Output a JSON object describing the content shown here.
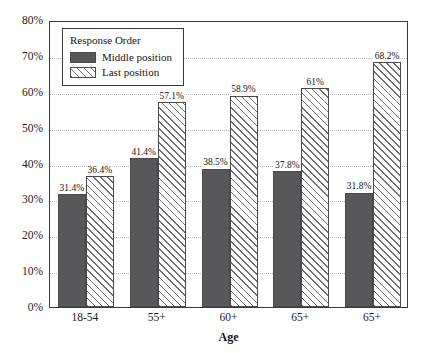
{
  "chart_data": {
    "type": "bar",
    "title": "",
    "xlabel": "Age",
    "ylabel": "",
    "ylim": [
      0,
      80
    ],
    "y_unit": "%",
    "grid": true,
    "legend_position": "upper-left-inside",
    "legend_title": "Response Order",
    "categories": [
      "18-54",
      "55+",
      "60+",
      "65+",
      "65+"
    ],
    "yticks": [
      "0%",
      "10%",
      "20%",
      "30%",
      "40%",
      "50%",
      "60%",
      "70%",
      "80%"
    ],
    "ytick_values": [
      0,
      10,
      20,
      30,
      40,
      50,
      60,
      70,
      80
    ],
    "series": [
      {
        "name": "Middle position",
        "values": [
          31.4,
          41.4,
          38.5,
          37.8,
          31.8
        ],
        "labels": [
          "31.4%",
          "41.4%",
          "38.5%",
          "37.8%",
          "31.8%"
        ],
        "color": "#58585a",
        "pattern": "solid"
      },
      {
        "name": "Last position",
        "values": [
          36.4,
          57.1,
          58.9,
          61.0,
          68.2
        ],
        "labels": [
          "36.4%",
          "57.1%",
          "58.9%",
          "61%",
          "68.2%"
        ],
        "color": "#ffffff",
        "pattern": "diagonal-hatch"
      }
    ]
  },
  "legend": {
    "title": "Response Order",
    "entries": [
      {
        "label": "Middle position",
        "swatch": "middle"
      },
      {
        "label": "Last position",
        "swatch": "last"
      }
    ]
  },
  "axes": {
    "x_title": "Age",
    "y_ticks": [
      "80%",
      "70%",
      "60%",
      "50%",
      "40%",
      "30%",
      "20%",
      "10%",
      "0%"
    ],
    "x_ticks": [
      "18-54",
      "55+",
      "60+",
      "65+",
      "65+"
    ]
  }
}
